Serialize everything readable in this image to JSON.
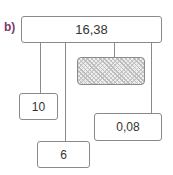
{
  "label": "b)",
  "top_box": {
    "value": "16,38"
  },
  "boxes": [
    {
      "value": "10"
    },
    {
      "value": "0,08"
    },
    {
      "value": "6"
    }
  ],
  "hidden_box": {
    "value": ""
  },
  "colors": {
    "label": "#7a3a6a",
    "border": "#8a8a8a"
  }
}
